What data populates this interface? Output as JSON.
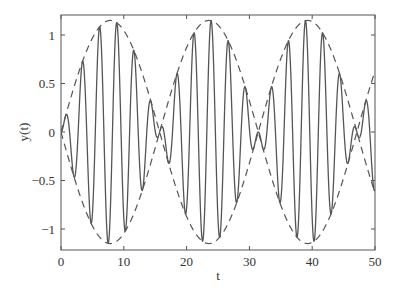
{
  "chart_data": {
    "type": "line",
    "title": "",
    "xlabel": "t",
    "ylabel": "y(t)",
    "xlim": [
      0,
      50
    ],
    "ylim": [
      -1.2,
      1.2
    ],
    "xticks": [
      0,
      10,
      20,
      30,
      40,
      50
    ],
    "xtick_labels": [
      "0",
      "10",
      "20",
      "30",
      "40",
      "50"
    ],
    "yticks": [
      1,
      0.5,
      0,
      -0.5,
      -1
    ],
    "ytick_labels": [
      "1",
      "0.5",
      "0",
      "−0.5",
      "−1"
    ],
    "grid": false,
    "legend": null,
    "series": [
      {
        "name": "signal",
        "style": "solid",
        "color": "#555555",
        "description": "amplitude-modulated oscillation (beat)",
        "envelope_amplitude": 1.15,
        "envelope_freq": 0.2,
        "carrier_freq": 2.3,
        "x_start": 0,
        "x_end": 50,
        "step": 0.02
      },
      {
        "name": "upper envelope",
        "style": "dashed",
        "color": "#555555",
        "amplitude": 1.15,
        "freq": 0.2,
        "sign": 1,
        "x_start": 0,
        "x_end": 50,
        "step": 0.05
      },
      {
        "name": "lower envelope",
        "style": "dashed",
        "color": "#555555",
        "amplitude": 1.15,
        "freq": 0.2,
        "sign": -1,
        "x_start": 0,
        "x_end": 50,
        "step": 0.05
      }
    ]
  }
}
